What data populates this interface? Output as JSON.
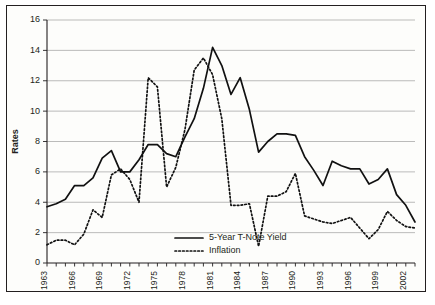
{
  "chart_data": {
    "type": "line",
    "title": "",
    "xlabel": "",
    "ylabel": "Rates",
    "ylim": [
      0,
      16
    ],
    "ytick_values": [
      0,
      2,
      4,
      6,
      8,
      10,
      12,
      14,
      16
    ],
    "ytick_labels": [
      "0",
      "2",
      "4",
      "6",
      "8",
      "10",
      "12",
      "14",
      "16"
    ],
    "xlim": [
      1963,
      2003
    ],
    "x": [
      1963,
      1964,
      1965,
      1966,
      1967,
      1968,
      1969,
      1970,
      1971,
      1972,
      1973,
      1974,
      1975,
      1976,
      1977,
      1978,
      1979,
      1980,
      1981,
      1982,
      1983,
      1984,
      1985,
      1986,
      1987,
      1988,
      1989,
      1990,
      1991,
      1992,
      1993,
      1994,
      1995,
      1996,
      1997,
      1998,
      1999,
      2000,
      2001,
      2002,
      2003
    ],
    "xtick_labels": [
      "1963",
      "1966",
      "1969",
      "1972",
      "1975",
      "1978",
      "1981",
      "1984",
      "1987",
      "1990",
      "1993",
      "1996",
      "1999",
      "2002"
    ],
    "xtick_values": [
      1963,
      1966,
      1969,
      1972,
      1975,
      1978,
      1981,
      1984,
      1987,
      1990,
      1993,
      1996,
      1999,
      2002
    ],
    "xtick_minor_step": 1,
    "grid": "horizontal",
    "legend_position": "inside-bottom-center",
    "series": [
      {
        "name": "5-Year T-Note Yield",
        "style": "solid",
        "color": "#111111",
        "values": [
          3.7,
          3.9,
          4.2,
          5.1,
          5.1,
          5.6,
          6.9,
          7.4,
          6.0,
          6.0,
          6.8,
          7.8,
          7.8,
          7.2,
          7.0,
          8.3,
          9.5,
          11.5,
          14.2,
          13.0,
          11.1,
          12.2,
          10.1,
          7.3,
          8.0,
          8.5,
          8.5,
          8.4,
          7.0,
          6.1,
          5.1,
          6.7,
          6.4,
          6.2,
          6.2,
          5.2,
          5.5,
          6.2,
          4.5,
          3.8,
          2.7
        ]
      },
      {
        "name": "Inflation",
        "style": "dotted",
        "color": "#111111",
        "values": [
          1.2,
          1.5,
          1.5,
          1.2,
          1.9,
          3.5,
          3.0,
          5.8,
          6.2,
          5.5,
          4.0,
          12.2,
          11.6,
          5.0,
          6.3,
          8.8,
          12.7,
          13.5,
          12.4,
          9.5,
          3.8,
          3.8,
          3.9,
          1.1,
          4.4,
          4.4,
          4.7,
          5.9,
          3.1,
          2.9,
          2.7,
          2.6,
          2.8,
          3.0,
          2.3,
          1.6,
          2.2,
          3.4,
          2.8,
          2.4,
          2.3
        ]
      }
    ]
  },
  "axis": {
    "y_title": "Rates"
  },
  "legend": {
    "items": [
      {
        "label": "5-Year T-Note Yield",
        "style": "solid"
      },
      {
        "label": "Inflation",
        "style": "dotted"
      }
    ]
  }
}
